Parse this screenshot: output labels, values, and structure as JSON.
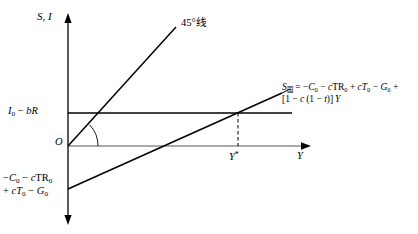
{
  "figure": {
    "type": "economics-diagram",
    "axes": {
      "y_label": "S, I",
      "x_label": "Y",
      "origin_label": "O"
    },
    "labels": {
      "line45": "45°线",
      "investment_intercept": "I0 − bR",
      "investment_intercept_parts": {
        "main": "I",
        "sub": "0",
        "rest": " − bR"
      },
      "saving_intercept_line1": "−C0 − cTR0",
      "saving_intercept_line2": "+ cT0 − G0",
      "equilibrium_output": "Y*",
      "saving_equation_line1": "S国 = −C0 − cTR0 + cT0 − G0 +",
      "saving_equation_line2": "[1 − c (1 − t)] Y",
      "saving_symbol": "S",
      "saving_subscript": "国"
    },
    "colors": {
      "ink": "#000000",
      "background": "#ffffff",
      "guide": "#555555"
    },
    "geometry": {
      "y_axis_x": 68,
      "origin_y": 146,
      "investment_line_y": 113,
      "investment_line_x_end": 292,
      "line45_end": [
        175,
        28
      ],
      "saving_line_start": [
        68,
        188
      ],
      "saving_line_end": [
        281,
        94
      ],
      "equilibrium_x": 238
    }
  }
}
